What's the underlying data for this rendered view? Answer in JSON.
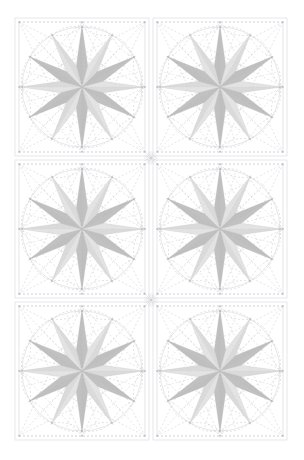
{
  "document": {
    "title": "Geometric Star Rosette Pattern Sheet",
    "background_color": "#ffffff",
    "width": 304,
    "height": 460
  },
  "chart_data": {
    "type": "diagram",
    "title": "Twelve-Point Star Rosette Tiling",
    "subtitle": "2 columns x 3 rows of identical compass-rose tiles",
    "grid": {
      "columns": 2,
      "rows": 3,
      "tile_count": 6,
      "sheet_margin_left": 13,
      "sheet_margin_top": 16,
      "tile_width": 138,
      "tile_height": 142,
      "col_origins_x": [
        13,
        151
      ],
      "row_origins_y": [
        16,
        158,
        300
      ]
    },
    "tile": {
      "name": "twelve-point-star-rosette",
      "points": 12,
      "outer_radius": 62,
      "inner_radius": 22,
      "circle_radius": 60,
      "frame_inset": 2,
      "center_offset_x": 69,
      "center_offset_y": 71,
      "start_angle_deg": -90,
      "alternating_shades": true
    },
    "colors": {
      "star_dark": "#b4b4b4",
      "star_light": "#dcdcdc",
      "star_mid": "#c8c8c8",
      "star_stroke": "#c0c0c0",
      "construction_line": "#b0b0b8",
      "circle_line": "#cfcfd4",
      "frame_line": "#d8d8dc",
      "vertex_marker": "#a8a8b0",
      "background": "#ffffff"
    },
    "line_styles": {
      "construction_dash": "2,2",
      "construction_width": 0.45,
      "circle_width": 0.5,
      "frame_width": 0.6
    },
    "elements": [
      "square-frame",
      "inscribed-circle",
      "dashed-diagonals",
      "dashed-polygon-web",
      "dashed-arcs",
      "twelve-point-star",
      "vertex-markers",
      "tile-junction-starburst"
    ],
    "legend": [],
    "annotations": []
  },
  "tiles": [
    {
      "id": "tile-r1-c1",
      "row": 1,
      "col": 1,
      "label": "Rosette 1"
    },
    {
      "id": "tile-r1-c2",
      "row": 1,
      "col": 2,
      "label": "Rosette 2"
    },
    {
      "id": "tile-r2-c1",
      "row": 2,
      "col": 1,
      "label": "Rosette 3"
    },
    {
      "id": "tile-r2-c2",
      "row": 2,
      "col": 2,
      "label": "Rosette 4"
    },
    {
      "id": "tile-r3-c1",
      "row": 3,
      "col": 1,
      "label": "Rosette 5"
    },
    {
      "id": "tile-r3-c2",
      "row": 3,
      "col": 2,
      "label": "Rosette 6"
    }
  ]
}
